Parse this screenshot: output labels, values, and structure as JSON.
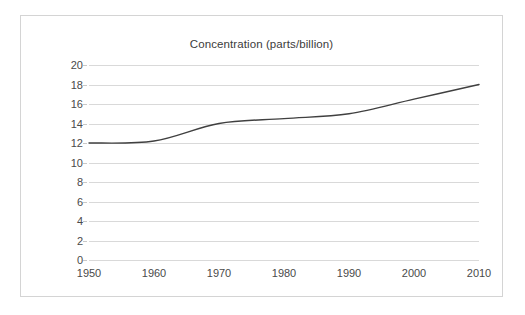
{
  "chart_data": {
    "type": "line",
    "title": "Concentration (parts/billion)",
    "xlabel": "",
    "ylabel": "",
    "x": [
      1950,
      1960,
      1970,
      1980,
      1990,
      2000,
      2010
    ],
    "categories": [
      "1950",
      "1960",
      "1970",
      "1980",
      "1990",
      "2000",
      "2010"
    ],
    "values": [
      12.0,
      12.2,
      14.0,
      14.5,
      15.0,
      16.5,
      18.0
    ],
    "series": [
      {
        "name": "Concentration",
        "values": [
          12.0,
          12.2,
          14.0,
          14.5,
          15.0,
          16.5,
          18.0
        ]
      }
    ],
    "xlim": [
      1950,
      2010
    ],
    "ylim": [
      0,
      20
    ],
    "y_ticks": [
      0,
      2,
      4,
      6,
      8,
      10,
      12,
      14,
      16,
      18,
      20
    ],
    "y_tick_labels": [
      "0",
      "2",
      "4",
      "6",
      "8",
      "10",
      "12",
      "14",
      "16",
      "18",
      "20"
    ],
    "x_tick_labels": [
      "1950",
      "1960",
      "1970",
      "1980",
      "1990",
      "2000",
      "2010"
    ],
    "grid": "horizontal",
    "legend": "none",
    "smooth": true,
    "colors": {
      "line": "#404040",
      "gridline": "#d9d9d9",
      "frame_border": "#d4d4d4",
      "text": "#4a4a4a",
      "title_text": "#3b3b3b",
      "background": "#ffffff"
    }
  }
}
